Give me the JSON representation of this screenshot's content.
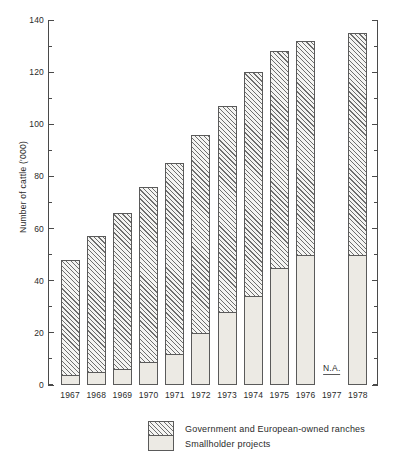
{
  "chart_data": {
    "type": "bar",
    "stacked": true,
    "title": "",
    "xlabel": "",
    "ylabel": "Number of cattle ('000)",
    "ylim": [
      0,
      140
    ],
    "ytick_major": [
      0,
      20,
      40,
      60,
      80,
      100,
      120,
      140
    ],
    "ytick_minor": [
      10,
      30,
      50,
      70,
      90,
      110,
      130
    ],
    "grid": false,
    "legend_position": "bottom",
    "categories": [
      "1967",
      "1968",
      "1969",
      "1970",
      "1971",
      "1972",
      "1973",
      "1974",
      "1975",
      "1976",
      "1977",
      "1978"
    ],
    "series": [
      {
        "name": "Smallholder projects",
        "pattern": "stipple",
        "values": [
          4,
          5,
          6,
          9,
          12,
          20,
          28,
          34,
          45,
          50,
          null,
          50
        ]
      },
      {
        "name": "Government and European-owned ranches",
        "pattern": "hatch",
        "values": [
          44,
          52,
          60,
          67,
          73,
          76,
          79,
          86,
          83,
          82,
          null,
          85
        ]
      }
    ],
    "totals": [
      48,
      57,
      66,
      76,
      85,
      96,
      107,
      120,
      128,
      132,
      null,
      135
    ],
    "missing_data_label": "N.A.",
    "missing_data_category": "1977"
  },
  "legend": {
    "items": [
      {
        "label": "Government and European-owned ranches",
        "pattern": "hatch"
      },
      {
        "label": "Smallholder projects",
        "pattern": "stipple"
      }
    ]
  },
  "colors": {
    "axis": "#4a4a4a",
    "bar_outline": "#5a5a5a",
    "hatch_line": "#6e6e6e",
    "hatch_fill": "#f4f4f2",
    "stipple_fill": "#eceae4",
    "stipple_dot": "#b9b6ae",
    "text": "#2a2a2a",
    "background": "#ffffff"
  }
}
